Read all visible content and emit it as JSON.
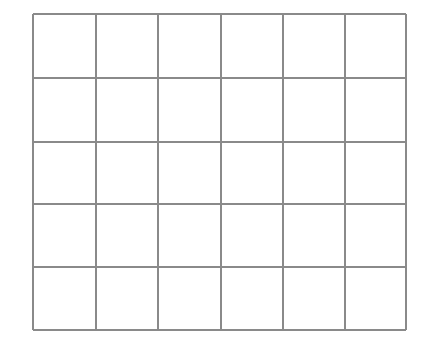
{
  "grid": {
    "rows": 5,
    "cols": 6,
    "x": [
      33,
      96,
      158,
      221,
      283,
      345,
      406
    ],
    "y": [
      14,
      78,
      142,
      204,
      267,
      330
    ],
    "line_color": "#8a8a8a",
    "background": "#ffffff"
  }
}
